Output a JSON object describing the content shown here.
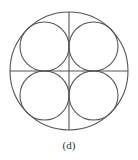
{
  "figure": {
    "caption": "(d)",
    "stroke_color": "#555555",
    "outer_circle": {
      "cx": 69,
      "cy": 71,
      "r": 59
    },
    "axes": {
      "vertical": {
        "x1": 69,
        "y1": 12,
        "x2": 69,
        "y2": 130
      },
      "horizontal": {
        "x1": 10,
        "y1": 71,
        "x2": 128,
        "y2": 71
      }
    },
    "inner_circles": [
      {
        "name": "top-left",
        "cx": 44.5,
        "cy": 46.5,
        "r": 24.5
      },
      {
        "name": "top-right",
        "cx": 93.5,
        "cy": 46.5,
        "r": 24.5
      },
      {
        "name": "bottom-left",
        "cx": 44.5,
        "cy": 95.5,
        "r": 24.5
      },
      {
        "name": "bottom-right",
        "cx": 93.5,
        "cy": 95.5,
        "r": 24.5
      }
    ]
  }
}
